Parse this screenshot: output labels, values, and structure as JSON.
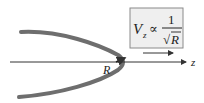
{
  "diagram": {
    "axis_label": "z",
    "radius_label": "R",
    "formula": {
      "lhs": "V",
      "lhs_subscript": "z",
      "relation": "∝",
      "numerator": "1",
      "radical": "√",
      "denominator": "R"
    },
    "colors": {
      "curve": "#6e6e6e",
      "axis": "#333333",
      "box_fill": "#efefef",
      "box_border": "#8a8a8a"
    }
  }
}
